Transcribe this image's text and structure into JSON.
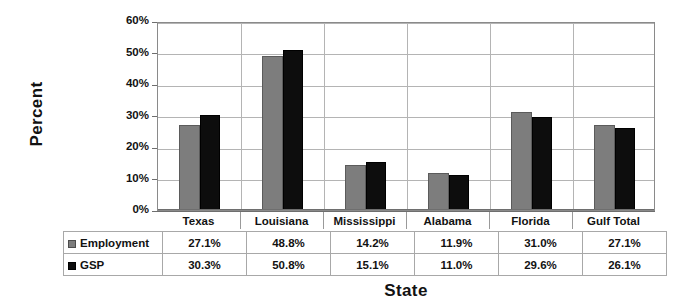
{
  "chart_data": {
    "type": "bar",
    "title": "",
    "xlabel": "State",
    "ylabel": "Percent",
    "categories": [
      "Texas",
      "Louisiana",
      "Mississippi",
      "Alabama",
      "Florida",
      "Gulf Total"
    ],
    "series": [
      {
        "name": "Employment",
        "color": "#7d7d7d",
        "values": [
          27.1,
          48.8,
          14.2,
          11.9,
          31.0,
          27.1
        ],
        "labels": [
          "27.1%",
          "48.8%",
          "14.2%",
          "11.9%",
          "31.0%",
          "27.1%"
        ]
      },
      {
        "name": "GSP",
        "color": "#0d0d0d",
        "values": [
          30.3,
          50.8,
          15.1,
          11.0,
          29.6,
          26.1
        ],
        "labels": [
          "30.3%",
          "50.8%",
          "15.1%",
          "11.0%",
          "29.6%",
          "26.1%"
        ]
      }
    ],
    "ylim": [
      0,
      60
    ],
    "yticks": [
      0,
      10,
      20,
      30,
      40,
      50,
      60
    ],
    "ytick_labels": [
      "0%",
      "10%",
      "20%",
      "30%",
      "40%",
      "50%",
      "60%"
    ],
    "grid": true,
    "legend_position": "data-table-row-headers"
  }
}
